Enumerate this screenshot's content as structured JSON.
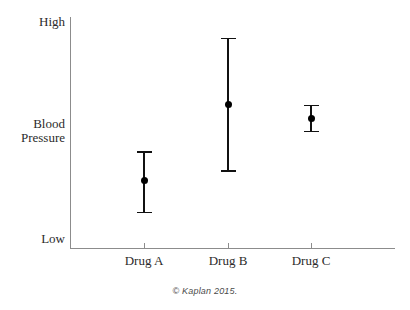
{
  "chart_data": {
    "type": "scatter",
    "title": "",
    "subtitle": "",
    "xlabel": "",
    "ylabel": "Blood Pressure",
    "categories": [
      "Drug A",
      "Drug B",
      "Drug C"
    ],
    "x_tick_labels": [
      "Drug A",
      "Drug B",
      "Drug C"
    ],
    "y_tick_labels": [
      "High",
      "Blood Pressure",
      "Low"
    ],
    "ylim": [
      0,
      1
    ],
    "ylim_labels": [
      "Low",
      "High"
    ],
    "grid": false,
    "legend": false,
    "legend_position": "none",
    "y_axis_is_qualitative": true,
    "annotations": [
      "© Kaplan 2015."
    ],
    "series": [
      {
        "name": "Blood Pressure",
        "marker": "filled-circle",
        "color": "#000000",
        "points": [
          {
            "category": "Drug A",
            "value": 0.29,
            "low": 0.15,
            "high": 0.42
          },
          {
            "category": "Drug B",
            "value": 0.62,
            "low": 0.33,
            "high": 0.91
          },
          {
            "category": "Drug C",
            "value": 0.56,
            "low": 0.5,
            "high": 0.62
          }
        ]
      }
    ]
  },
  "axes": {
    "y_label_high": "High",
    "y_label_mid_line1": "Blood",
    "y_label_mid_line2": "Pressure",
    "y_label_low": "Low",
    "x_labels": [
      "Drug A",
      "Drug B",
      "Drug C"
    ]
  },
  "footer": {
    "credit": "© Kaplan 2015."
  },
  "colors": {
    "axis": "#8c8c8c",
    "marker": "#000000",
    "errorbar": "#111111",
    "background": "#ffffff",
    "text": "#2b2b2b"
  }
}
